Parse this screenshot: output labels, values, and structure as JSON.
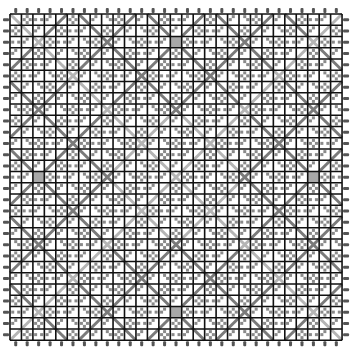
{
  "diagram": {
    "type": "grid-pattern",
    "rows": 29,
    "cols": 29,
    "cell_width": 11.45,
    "cell_height": 11.25,
    "origin": [
      10,
      14
    ],
    "diagonal_period": 6,
    "slash_offset": 4,
    "backslash_offset": 0,
    "gray_cells": [
      [
        2,
        14
      ],
      [
        14,
        2
      ],
      [
        14,
        26
      ],
      [
        26,
        14
      ]
    ],
    "colors": {
      "grid_line": "#111111",
      "diagonal_dark": "#7a7a7a",
      "diagonal_light": "#b5b5b5",
      "nub": "#8a8a8a",
      "gray_cell": "#a8a8a8",
      "pin": "#555555",
      "background": "#ffffff"
    }
  }
}
